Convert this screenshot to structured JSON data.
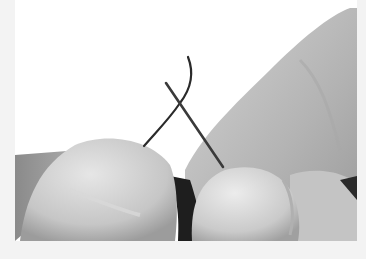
{
  "image": {
    "subject": "Two hands' fingertips holding a needle and a thread, threading the needle",
    "style": "grayscale photograph",
    "colors": {
      "border": "#f3f3f3",
      "background": "#ffffff",
      "skin_light": "#d9d9d9",
      "skin_mid": "#b8b8b8",
      "skin_dark": "#7a7a7a",
      "shadow": "#1e1e1e",
      "needle": "#3a3a3a",
      "thread": "#2a2a2a"
    }
  }
}
